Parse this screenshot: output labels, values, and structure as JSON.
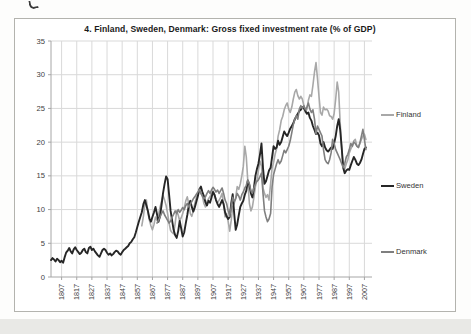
{
  "chart_data": {
    "type": "line",
    "title": "4. Finland, Sweden, Denmark: Gross fixed investment rate (% of GDP)",
    "xlabel": "",
    "ylabel": "",
    "ylim": [
      0,
      35
    ],
    "y_ticks": [
      0,
      5,
      10,
      15,
      20,
      25,
      30,
      35
    ],
    "x_tick_years": [
      1807,
      1817,
      1827,
      1837,
      1847,
      1857,
      1867,
      1877,
      1887,
      1897,
      1907,
      1917,
      1927,
      1937,
      1947,
      1957,
      1967,
      1977,
      1987,
      1997,
      2007
    ],
    "x_domain": [
      1800,
      2012
    ],
    "grid": true,
    "legend_position": "right",
    "colors": {
      "gridline": "#d9d9d9",
      "axis": "#a6a6a6",
      "tick_label": "#404040"
    },
    "series": [
      {
        "name": "Finland",
        "color": "#a8a8a8",
        "width": 1.6,
        "start_year": 1860,
        "values": [
          7.6,
          9.0,
          10.8,
          11.4,
          9.6,
          8.4,
          7.6,
          7.0,
          7.8,
          8.9,
          8.4,
          9.2,
          10.3,
          11.2,
          12.1,
          11.4,
          10.6,
          9.4,
          8.0,
          6.9,
          6.6,
          6.4,
          8.0,
          9.8,
          9.2,
          8.3,
          8.8,
          9.4,
          10.2,
          11.3,
          11.9,
          10.8,
          9.4,
          9.0,
          9.8,
          10.9,
          11.8,
          12.4,
          13.0,
          12.4,
          12.0,
          10.9,
          10.4,
          11.2,
          11.6,
          11.9,
          12.4,
          12.8,
          12.2,
          11.4,
          11.0,
          11.4,
          11.8,
          12.4,
          10.8,
          8.9,
          9.4,
          8.2,
          6.8,
          8.4,
          10.4,
          10.9,
          11.8,
          13.4,
          13.0,
          13.8,
          15.0,
          16.4,
          19.4,
          17.8,
          14.2,
          10.9,
          9.8,
          10.4,
          11.8,
          13.4,
          14.4,
          15.8,
          17.2,
          16.4,
          13.2,
          12.4,
          11.8,
          12.2,
          11.4,
          13.8,
          16.2,
          17.0,
          18.2,
          19.0,
          20.9,
          21.8,
          23.2,
          23.8,
          24.8,
          25.4,
          25.8,
          24.9,
          24.4,
          25.2,
          26.4,
          27.4,
          27.8,
          26.9,
          26.4,
          26.8,
          26.4,
          25.4,
          24.4,
          24.9,
          26.2,
          27.0,
          26.8,
          28.4,
          30.4,
          31.8,
          29.4,
          26.8,
          24.4,
          24.0,
          25.2,
          24.8,
          24.9,
          24.6,
          23.9,
          23.8,
          23.4,
          24.2,
          26.4,
          28.9,
          27.4,
          22.8,
          18.9,
          16.4,
          16.0,
          16.8,
          17.4,
          18.4,
          19.0,
          19.4,
          20.2,
          20.4,
          19.4,
          19.2,
          19.8,
          20.4,
          20.9,
          21.2,
          20.4
        ]
      },
      {
        "name": "Sweden",
        "color": "#262626",
        "width": 1.9,
        "start_year": 1800,
        "values": [
          2.5,
          2.8,
          2.6,
          2.3,
          2.7,
          2.5,
          2.2,
          2.4,
          2.1,
          2.9,
          3.6,
          3.9,
          4.3,
          3.8,
          3.5,
          4.1,
          4.4,
          4.0,
          3.7,
          3.4,
          3.6,
          4.0,
          4.2,
          3.7,
          3.5,
          4.3,
          4.5,
          4.0,
          4.2,
          3.8,
          3.5,
          3.2,
          3.0,
          3.5,
          4.0,
          4.2,
          4.0,
          3.6,
          3.3,
          3.5,
          3.2,
          3.4,
          3.7,
          3.9,
          3.8,
          3.5,
          3.3,
          3.7,
          4.0,
          4.2,
          4.4,
          4.6,
          5.0,
          5.2,
          5.6,
          5.9,
          6.6,
          7.4,
          8.2,
          8.9,
          9.6,
          10.8,
          11.4,
          10.6,
          9.8,
          8.7,
          8.2,
          8.9,
          9.6,
          10.4,
          9.3,
          8.2,
          9.0,
          10.6,
          12.4,
          13.8,
          14.9,
          14.5,
          12.2,
          9.8,
          8.4,
          7.0,
          6.2,
          5.8,
          6.8,
          8.3,
          7.2,
          6.0,
          6.6,
          8.0,
          9.2,
          10.6,
          11.3,
          10.4,
          9.7,
          10.3,
          11.2,
          12.0,
          13.0,
          13.4,
          12.6,
          12.0,
          11.1,
          10.6,
          11.3,
          11.0,
          11.8,
          12.6,
          12.2,
          11.4,
          10.8,
          10.4,
          10.9,
          11.4,
          10.8,
          9.6,
          9.0,
          8.6,
          8.9,
          10.9,
          12.3,
          9.4,
          7.0,
          7.8,
          9.2,
          10.4,
          10.9,
          11.3,
          12.2,
          12.8,
          14.3,
          13.6,
          12.4,
          11.8,
          13.2,
          15.0,
          16.0,
          16.8,
          18.2,
          19.8,
          16.2,
          13.8,
          14.2,
          15.0,
          15.8,
          16.2,
          17.8,
          19.4,
          19.0,
          19.2,
          20.2,
          19.6,
          20.0,
          20.8,
          21.6,
          21.2,
          20.9,
          21.4,
          22.0,
          22.4,
          22.8,
          23.4,
          23.8,
          24.2,
          24.6,
          24.8,
          25.2,
          25.0,
          24.6,
          24.2,
          24.4,
          23.6,
          23.2,
          22.4,
          21.8,
          21.2,
          21.4,
          21.0,
          19.8,
          19.4,
          20.0,
          19.2,
          18.8,
          18.6,
          18.9,
          19.2,
          19.0,
          19.8,
          20.9,
          22.4,
          23.4,
          21.8,
          19.2,
          16.2,
          15.4,
          15.8,
          16.0,
          15.9,
          16.6,
          17.2,
          17.8,
          17.4,
          16.8,
          16.6,
          16.9,
          17.4,
          18.2,
          19.0,
          19.2
        ]
      },
      {
        "name": "Denmark",
        "color": "#7f7f7f",
        "width": 1.6,
        "start_year": 1870,
        "values": [
          8.0,
          8.4,
          8.9,
          9.4,
          9.8,
          9.2,
          8.8,
          8.4,
          8.0,
          8.3,
          8.9,
          9.3,
          9.8,
          9.4,
          10.0,
          9.6,
          9.9,
          10.3,
          10.0,
          10.6,
          10.9,
          10.4,
          10.8,
          11.2,
          11.6,
          11.9,
          12.3,
          12.6,
          13.0,
          12.4,
          12.0,
          11.6,
          11.9,
          12.4,
          12.8,
          12.4,
          12.9,
          13.3,
          13.0,
          12.6,
          12.9,
          12.4,
          12.8,
          13.2,
          12.4,
          11.4,
          10.9,
          9.8,
          9.0,
          10.4,
          11.8,
          11.2,
          11.6,
          12.4,
          12.0,
          11.4,
          12.2,
          12.6,
          13.2,
          13.6,
          14.4,
          13.8,
          12.8,
          12.4,
          13.2,
          13.8,
          14.2,
          14.4,
          14.9,
          15.4,
          12.4,
          9.8,
          8.9,
          8.2,
          8.6,
          9.4,
          13.4,
          15.2,
          16.0,
          16.8,
          17.4,
          16.8,
          17.2,
          18.0,
          18.8,
          18.4,
          18.9,
          19.4,
          20.2,
          21.4,
          22.6,
          23.4,
          23.9,
          23.4,
          24.9,
          25.4,
          25.0,
          25.4,
          24.8,
          25.2,
          25.8,
          24.9,
          24.4,
          24.8,
          23.4,
          21.2,
          22.4,
          21.9,
          21.4,
          20.9,
          18.9,
          17.4,
          17.0,
          16.8,
          17.4,
          18.4,
          20.4,
          19.8,
          18.9,
          18.4,
          17.9,
          17.4,
          16.8,
          16.2,
          16.8,
          17.8,
          18.2,
          18.9,
          19.8,
          19.4,
          20.0,
          19.8,
          19.4,
          19.2,
          19.9,
          20.9,
          21.9,
          20.4,
          18.9
        ]
      }
    ]
  }
}
